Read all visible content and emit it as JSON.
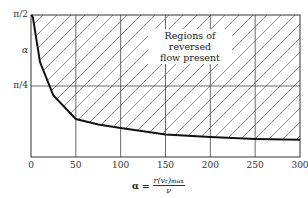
{
  "chart_data": {
    "type": "line",
    "title": "",
    "xlabel": "α = r(v_r)max / ν",
    "ylabel": "α",
    "xlim": [
      0,
      300
    ],
    "ylim": [
      0,
      1.5708
    ],
    "x_ticks": [
      "0",
      "50",
      "100",
      "150",
      "200",
      "250",
      "300"
    ],
    "y_ticks": [
      "π/4",
      "π/2"
    ],
    "grid": true,
    "series": [
      {
        "name": "boundary curve",
        "x": [
          2,
          10,
          25,
          50,
          75,
          100,
          150,
          200,
          250,
          300
        ],
        "y": [
          1.55,
          1.05,
          0.68,
          0.42,
          0.36,
          0.32,
          0.25,
          0.22,
          0.2,
          0.19
        ]
      }
    ],
    "annotations": [
      {
        "text": "Regions of reversed flow present",
        "region": "above curve, hatched"
      }
    ]
  },
  "labels": {
    "y_top": "π/2",
    "y_mid": "π/4",
    "y_axis": "α",
    "x_ticks": [
      "0",
      "50",
      "100",
      "150",
      "200",
      "250",
      "300"
    ],
    "region_line1": "Regions of reversed",
    "region_line2": "flow present",
    "xlabel_lhs": "α =",
    "xlabel_num": "r(v",
    "xlabel_num_sub": "r",
    "xlabel_num_tail": ")",
    "xlabel_num_max": "max",
    "xlabel_den": "ν"
  }
}
